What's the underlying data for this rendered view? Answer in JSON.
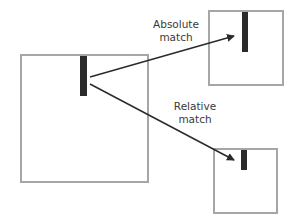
{
  "diagram": {
    "source_box": {
      "name": "source-frame"
    },
    "targets": [
      {
        "id": "absolute",
        "label_line1": "Absolute",
        "label_line2": "match"
      },
      {
        "id": "relative",
        "label_line1": "Relative",
        "label_line2": "match"
      }
    ],
    "colors": {
      "box_border": "#a6a6a6",
      "bar": "#2b2b2b",
      "arrow": "#2b2b2b",
      "text": "#3a3a3a"
    }
  }
}
